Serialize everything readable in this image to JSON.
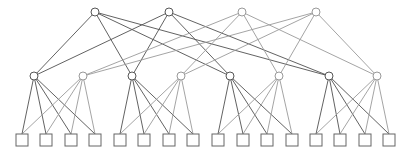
{
  "diagram": {
    "type": "fat-tree-topology",
    "colors": {
      "dark_edge": "#505050",
      "light_edge": "#9a9a9a",
      "dark_node": "#555555",
      "light_node": "#999999",
      "host_stroke": "#666666",
      "background": "#ffffff"
    },
    "core": [
      {
        "id": "c1",
        "x": 95,
        "y": 12,
        "shade": "dark"
      },
      {
        "id": "c2",
        "x": 169,
        "y": 12,
        "shade": "dark"
      },
      {
        "id": "c3",
        "x": 242,
        "y": 12,
        "shade": "light"
      },
      {
        "id": "c4",
        "x": 316,
        "y": 12,
        "shade": "light"
      }
    ],
    "aggregation": [
      {
        "id": "a1",
        "x": 34,
        "y": 76,
        "shade": "dark"
      },
      {
        "id": "a2",
        "x": 83,
        "y": 76,
        "shade": "light"
      },
      {
        "id": "a3",
        "x": 132,
        "y": 76,
        "shade": "dark"
      },
      {
        "id": "a4",
        "x": 181,
        "y": 76,
        "shade": "light"
      },
      {
        "id": "a5",
        "x": 230,
        "y": 76,
        "shade": "dark"
      },
      {
        "id": "a6",
        "x": 279,
        "y": 76,
        "shade": "light"
      },
      {
        "id": "a7",
        "x": 329,
        "y": 76,
        "shade": "dark"
      },
      {
        "id": "a8",
        "x": 377,
        "y": 76,
        "shade": "light"
      }
    ],
    "hosts": [
      {
        "id": "h1",
        "x": 22,
        "y": 140
      },
      {
        "id": "h2",
        "x": 46,
        "y": 140
      },
      {
        "id": "h3",
        "x": 71,
        "y": 140
      },
      {
        "id": "h4",
        "x": 95,
        "y": 140
      },
      {
        "id": "h5",
        "x": 120,
        "y": 140
      },
      {
        "id": "h6",
        "x": 144,
        "y": 140
      },
      {
        "id": "h7",
        "x": 169,
        "y": 140
      },
      {
        "id": "h8",
        "x": 193,
        "y": 140
      },
      {
        "id": "h9",
        "x": 218,
        "y": 140
      },
      {
        "id": "h10",
        "x": 243,
        "y": 140
      },
      {
        "id": "h11",
        "x": 267,
        "y": 140
      },
      {
        "id": "h12",
        "x": 292,
        "y": 140
      },
      {
        "id": "h13",
        "x": 316,
        "y": 140
      },
      {
        "id": "h14",
        "x": 340,
        "y": 140
      },
      {
        "id": "h15",
        "x": 365,
        "y": 140
      },
      {
        "id": "h16",
        "x": 389,
        "y": 140
      }
    ],
    "core_links": {
      "c1": [
        "a1",
        "a3",
        "a5",
        "a7"
      ],
      "c2": [
        "a1",
        "a3",
        "a5",
        "a7"
      ],
      "c3": [
        "a2",
        "a4",
        "a6",
        "a8"
      ],
      "c4": [
        "a2",
        "a4",
        "a6",
        "a8"
      ]
    },
    "pod_links": {
      "a1": [
        "h1",
        "h2",
        "h3",
        "h4"
      ],
      "a2": [
        "h1",
        "h2",
        "h3",
        "h4"
      ],
      "a3": [
        "h5",
        "h6",
        "h7",
        "h8"
      ],
      "a4": [
        "h5",
        "h6",
        "h7",
        "h8"
      ],
      "a5": [
        "h9",
        "h10",
        "h11",
        "h12"
      ],
      "a6": [
        "h9",
        "h10",
        "h11",
        "h12"
      ],
      "a7": [
        "h13",
        "h14",
        "h15",
        "h16"
      ],
      "a8": [
        "h13",
        "h14",
        "h15",
        "h16"
      ]
    },
    "node_radius": 4,
    "host_size": 12
  }
}
